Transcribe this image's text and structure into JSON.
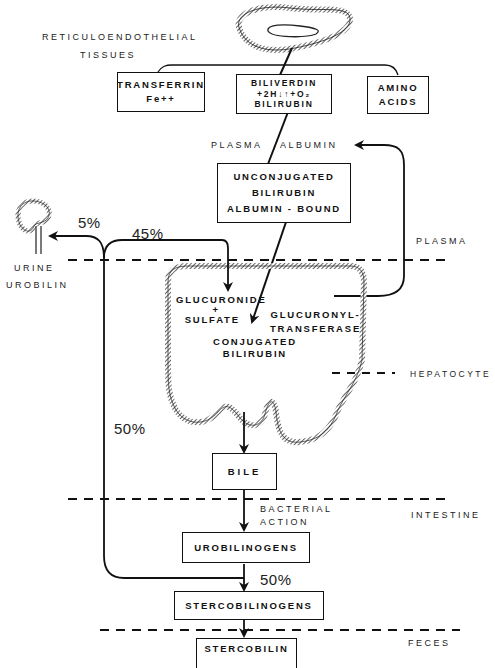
{
  "diagram": {
    "source_tissue": {
      "line1": "RETICULOENDOTHELIAL",
      "line2": "TISSUES"
    },
    "top_boxes": {
      "transferrin": {
        "line1": "TRANSFERRIN",
        "line2": "Fe++"
      },
      "biliverdin": {
        "line1": "BILIVERDIN",
        "line2": "+2H↓↑+O₂",
        "line3": "BILIRUBIN"
      },
      "amino_acids": {
        "line1": "AMINO",
        "line2": "ACIDS"
      }
    },
    "plasma_albumin": {
      "left": "PLASMA",
      "right": "ALBUMIN"
    },
    "unconjugated_box": {
      "line1": "UNCONJUGATED",
      "line2": "BILIRUBIN",
      "line3": "ALBUMIN - BOUND"
    },
    "urine": {
      "line1": "URINE",
      "line2": "UROBILIN"
    },
    "percentages": {
      "to_urine": "5%",
      "to_liver": "45%",
      "enterohepatic": "50%",
      "to_stool": "50%"
    },
    "hepatocyte": {
      "glucuronide": {
        "line1": "GLUCURONIDE",
        "line2": "+",
        "line3": "SULFATE"
      },
      "enzyme": {
        "line1": "GLUCURONYL-",
        "line2": "TRANSFERASE"
      },
      "product": {
        "line1": "CONJUGATED",
        "line2": "BILIRUBIN"
      }
    },
    "bile_box": "BILE",
    "bacterial_action": {
      "line1": "BACTERIAL",
      "line2": "ACTION"
    },
    "urobilinogens_box": "UROBILINOGENS",
    "stercobilinogens_box": "STERCOBILINOGENS",
    "stercobilin_box": "STERCOBILIN",
    "compartments": {
      "plasma": "PLASMA",
      "hepatocyte": "HEPATOCYTE",
      "intestine": "INTESTINE",
      "feces": "FECES"
    }
  }
}
